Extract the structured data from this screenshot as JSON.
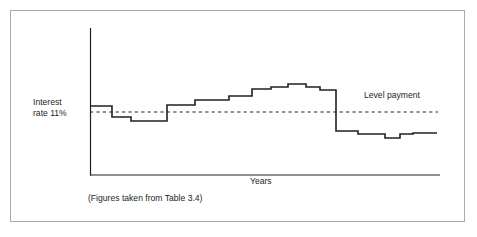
{
  "figure": {
    "border_color": "#a9a9a9",
    "background": "#ffffff",
    "line_color": "#231f20",
    "text_color": "#231f20"
  },
  "labels": {
    "y_axis_line1": "Interest",
    "y_axis_line2": "rate 11%",
    "level_payment": "Level payment",
    "x_axis": "Years",
    "source_note": "(Figures taken from Table 3.4)"
  },
  "chart_data": {
    "type": "line",
    "subtype": "step",
    "title": "",
    "xlabel": "Years",
    "ylabel": "Interest rate 11%",
    "grid": false,
    "legend": "none",
    "axis": {
      "x_start_px": 90,
      "x_end_px": 440,
      "y_top_px": 28,
      "y_baseline_px": 175
    },
    "annotations": [
      {
        "name": "level-payment",
        "text": "Level payment",
        "style": "dashed-horizontal-reference-line",
        "y_px": 112,
        "x_from_px": 90,
        "x_to_px": 438
      },
      {
        "name": "source-note",
        "text": "(Figures taken from Table 3.4)"
      }
    ],
    "series": [
      {
        "name": "Variable interest payment",
        "style": "step",
        "description": "Stepped payment profile starting at the 11% level, dipping slightly below the level payment, climbing through successive higher steps to a peak plateau, then dropping sharply well below the level payment for the remaining years.",
        "steps": [
          {
            "year": 1,
            "x_from_px": 90,
            "x_to_px": 112,
            "y_px": 106
          },
          {
            "year": 2,
            "x_from_px": 112,
            "x_to_px": 131,
            "y_px": 117
          },
          {
            "year": 3,
            "x_from_px": 131,
            "x_to_px": 167,
            "y_px": 121
          },
          {
            "year": 4,
            "x_from_px": 167,
            "x_to_px": 195,
            "y_px": 105
          },
          {
            "year": 5,
            "x_from_px": 195,
            "x_to_px": 229,
            "y_px": 100
          },
          {
            "year": 6,
            "x_from_px": 229,
            "x_to_px": 252,
            "y_px": 96
          },
          {
            "year": 7,
            "x_from_px": 252,
            "x_to_px": 271,
            "y_px": 89
          },
          {
            "year": 8,
            "x_from_px": 271,
            "x_to_px": 288,
            "y_px": 87
          },
          {
            "year": 9,
            "x_from_px": 288,
            "x_to_px": 306,
            "y_px": 84
          },
          {
            "year": 10,
            "x_from_px": 306,
            "x_to_px": 320,
            "y_px": 87
          },
          {
            "year": 11,
            "x_from_px": 320,
            "x_to_px": 336,
            "y_px": 90
          },
          {
            "year": 12,
            "x_from_px": 336,
            "x_to_px": 358,
            "y_px": 131
          },
          {
            "year": 13,
            "x_from_px": 358,
            "x_to_px": 385,
            "y_px": 134
          },
          {
            "year": 14,
            "x_from_px": 385,
            "x_to_px": 400,
            "y_px": 138
          },
          {
            "year": 15,
            "x_from_px": 400,
            "x_to_px": 413,
            "y_px": 134
          },
          {
            "year": 16,
            "x_from_px": 413,
            "x_to_px": 437,
            "y_px": 133
          }
        ]
      }
    ]
  }
}
